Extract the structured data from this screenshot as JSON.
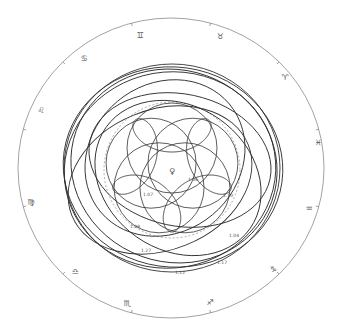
{
  "diagram": {
    "center_symbol": "♀",
    "outer_ring": {
      "cx": 171,
      "cy": 168,
      "rx": 153,
      "ry": 150,
      "color": "#8a8a8a"
    },
    "zodiac": [
      {
        "symbol": "♉",
        "name": "taurus",
        "x": 220,
        "y": 36
      },
      {
        "symbol": "♊",
        "name": "gemini",
        "x": 140,
        "y": 35
      },
      {
        "symbol": "♋",
        "name": "cancer",
        "x": 84,
        "y": 58
      },
      {
        "symbol": "♌",
        "name": "leo",
        "x": 41,
        "y": 110
      },
      {
        "symbol": "♍",
        "name": "virgo",
        "x": 31,
        "y": 202
      },
      {
        "symbol": "♎",
        "name": "libra",
        "x": 75,
        "y": 271
      },
      {
        "symbol": "♏",
        "name": "scorpio",
        "x": 127,
        "y": 303
      },
      {
        "symbol": "♐",
        "name": "sagittarius",
        "x": 210,
        "y": 302
      },
      {
        "symbol": "♑",
        "name": "capricorn",
        "x": 273,
        "y": 269
      },
      {
        "symbol": "♒",
        "name": "aquarius",
        "x": 309,
        "y": 208
      },
      {
        "symbol": "♓",
        "name": "pisces",
        "x": 318,
        "y": 142
      },
      {
        "symbol": "♈",
        "name": "aries",
        "x": 285,
        "y": 77
      }
    ],
    "distance_labels": [
      {
        "text": "1.06",
        "x": 193,
        "y": 181
      },
      {
        "text": "1.07",
        "x": 148,
        "y": 196
      },
      {
        "text": "1.08",
        "x": 135,
        "y": 228
      },
      {
        "text": "1.10",
        "x": 228,
        "y": 197
      },
      {
        "text": "1.04",
        "x": 234,
        "y": 237
      },
      {
        "text": "1.27",
        "x": 146,
        "y": 252
      },
      {
        "text": "1.17",
        "x": 222,
        "y": 264
      },
      {
        "text": "1.12",
        "x": 180,
        "y": 274
      }
    ],
    "ellipses": [
      {
        "cx": 172,
        "cy": 168,
        "rx": 108,
        "ry": 104,
        "rot": 0
      },
      {
        "cx": 173,
        "cy": 167,
        "rx": 110,
        "ry": 100,
        "rot": 8
      },
      {
        "cx": 170,
        "cy": 170,
        "rx": 106,
        "ry": 98,
        "rot": -10
      },
      {
        "cx": 174,
        "cy": 166,
        "rx": 104,
        "ry": 96,
        "rot": 20
      },
      {
        "cx": 180,
        "cy": 160,
        "rx": 92,
        "ry": 66,
        "rot": 12
      },
      {
        "cx": 160,
        "cy": 180,
        "rx": 95,
        "ry": 70,
        "rot": -22
      },
      {
        "cx": 178,
        "cy": 178,
        "rx": 88,
        "ry": 72,
        "rot": 35
      },
      {
        "cx": 165,
        "cy": 158,
        "rx": 84,
        "ry": 74,
        "rot": -40
      }
    ],
    "dashed_circle": {
      "cx": 172,
      "cy": 170,
      "r": 68
    },
    "rosette": {
      "cx": 172,
      "cy": 170,
      "big": 28,
      "small": 35,
      "petals": 5,
      "ratio": 1.6
    },
    "line_color": "#333333"
  }
}
